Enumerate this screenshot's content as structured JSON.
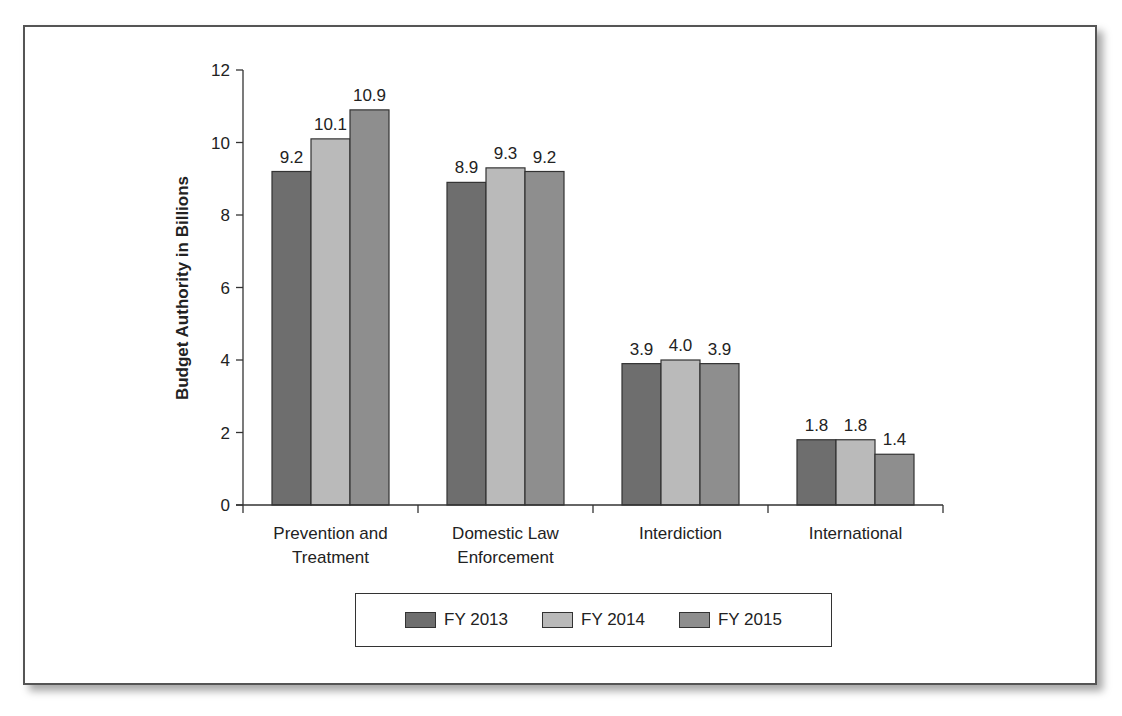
{
  "chart_data": {
    "type": "bar",
    "title": "",
    "xlabel": "",
    "ylabel": "Budget Authority in Billions",
    "ylim": [
      0,
      12
    ],
    "yticks": [
      0,
      2,
      4,
      6,
      8,
      10,
      12
    ],
    "grid": false,
    "legend_position": "bottom",
    "categories": [
      "Prevention and Treatment",
      "Domestic Law Enforcement",
      "Interdiction",
      "International"
    ],
    "category_lines": [
      [
        "Prevention and",
        "Treatment"
      ],
      [
        "Domestic Law",
        "Enforcement"
      ],
      [
        "Interdiction"
      ],
      [
        "International"
      ]
    ],
    "series": [
      {
        "name": "FY 2013",
        "color": "#6e6e6e",
        "values": [
          9.2,
          8.9,
          3.9,
          1.8
        ]
      },
      {
        "name": "FY 2014",
        "color": "#bababa",
        "values": [
          10.1,
          9.3,
          4.0,
          1.8
        ]
      },
      {
        "name": "FY 2015",
        "color": "#8e8e8e",
        "values": [
          10.9,
          9.2,
          3.9,
          1.4
        ]
      }
    ],
    "data_labels": [
      [
        "9.2",
        "10.1",
        "10.9"
      ],
      [
        "8.9",
        "9.3",
        "9.2"
      ],
      [
        "3.9",
        "4.0",
        "3.9"
      ],
      [
        "1.8",
        "1.8",
        "1.4"
      ]
    ]
  },
  "legend": {
    "items": [
      {
        "label": "FY 2013",
        "color": "#6e6e6e"
      },
      {
        "label": "FY 2014",
        "color": "#bababa"
      },
      {
        "label": "FY 2015",
        "color": "#8e8e8e"
      }
    ]
  }
}
